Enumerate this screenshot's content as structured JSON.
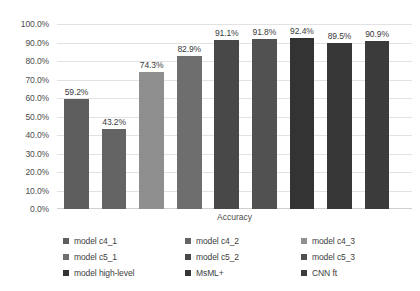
{
  "chart_data": {
    "type": "bar",
    "title": "",
    "xlabel": "Accuracy",
    "ylabel": "",
    "ylim": [
      0,
      1.0
    ],
    "grid": true,
    "legend_position": "bottom",
    "categories": [
      "model c4_1",
      "model c4_2",
      "model c4_3",
      "model c5_1",
      "model c5_2",
      "model c5_3",
      "model high-level",
      "MsML+",
      "CNN ft"
    ],
    "values": [
      0.592,
      0.432,
      0.743,
      0.829,
      0.911,
      0.918,
      0.924,
      0.895,
      0.909
    ],
    "data_labels": [
      "59.2%",
      "43.2%",
      "74.3%",
      "82.9%",
      "91.1%",
      "91.8%",
      "92.4%",
      "89.5%",
      "90.9%"
    ],
    "colors": [
      "#5e5e5e",
      "#646464",
      "#8f8f8f",
      "#6e6e6e",
      "#484848",
      "#515151",
      "#333333",
      "#373737",
      "#3b3b3b"
    ],
    "yticks": [
      "0.0%",
      "10.0%",
      "20.0%",
      "30.0%",
      "40.0%",
      "50.0%",
      "60.0%",
      "70.0%",
      "80.0%",
      "90.0%",
      "100.0%"
    ],
    "ytick_values": [
      0,
      0.1,
      0.2,
      0.3,
      0.4,
      0.5,
      0.6,
      0.7,
      0.8,
      0.9,
      1.0
    ]
  },
  "legend": {
    "entries": [
      {
        "label": "model c4_1",
        "color": "#5e5e5e"
      },
      {
        "label": "model c4_2",
        "color": "#646464"
      },
      {
        "label": "model c4_3",
        "color": "#8f8f8f"
      },
      {
        "label": "model c5_1",
        "color": "#6e6e6e"
      },
      {
        "label": "model c5_2",
        "color": "#484848"
      },
      {
        "label": "model c5_3",
        "color": "#515151"
      },
      {
        "label": "model high-level",
        "color": "#333333"
      },
      {
        "label": "MsML+",
        "color": "#373737"
      },
      {
        "label": "CNN ft",
        "color": "#3b3b3b"
      }
    ]
  },
  "axis": {
    "x_title": "Accuracy"
  }
}
